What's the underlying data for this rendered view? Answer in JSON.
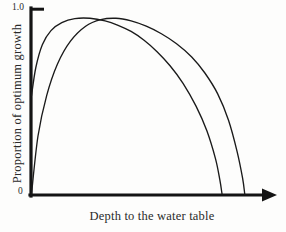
{
  "chart_data": {
    "type": "line",
    "title": "",
    "subtitle": "",
    "xlabel": "Depth to the water table",
    "ylabel": "Proportion of optimum growth",
    "xlim": [
      0,
      1
    ],
    "ylim": [
      0,
      1.05
    ],
    "grid": false,
    "legend": "none",
    "x_tick_labels": [],
    "y_tick_labels": [
      "0",
      "1.0"
    ],
    "y_ticks": [
      0,
      1.0
    ],
    "axis_color": "#141414",
    "curve_color": "#1a1a1a",
    "x_axis_has_arrow": true,
    "annotations": [],
    "series": [
      {
        "name": "shallow-rooted species",
        "color": "#1a1a1a",
        "comment": "rises steeply from y-axis, peaks early, declines to zero at intermediate depth",
        "x": [
          0.0,
          0.02,
          0.05,
          0.09,
          0.14,
          0.2,
          0.27,
          0.34,
          0.4,
          0.46,
          0.52,
          0.58,
          0.64,
          0.7,
          0.76,
          0.81,
          0.85,
          0.87,
          0.88
        ],
        "y": [
          0.56,
          0.72,
          0.85,
          0.93,
          0.975,
          0.998,
          1.0,
          0.985,
          0.96,
          0.925,
          0.875,
          0.81,
          0.73,
          0.63,
          0.5,
          0.36,
          0.2,
          0.08,
          0.0
        ]
      },
      {
        "name": "deep-rooted species",
        "color": "#1a1a1a",
        "comment": "rises more gradually from lower start, peaks slightly later, persists to greater depth",
        "x": [
          0.0,
          0.03,
          0.07,
          0.12,
          0.18,
          0.25,
          0.32,
          0.39,
          0.46,
          0.53,
          0.6,
          0.67,
          0.74,
          0.8,
          0.86,
          0.91,
          0.95,
          0.975,
          0.985
        ],
        "y": [
          0.0,
          0.33,
          0.56,
          0.74,
          0.87,
          0.955,
          0.992,
          1.0,
          0.985,
          0.955,
          0.912,
          0.855,
          0.78,
          0.69,
          0.57,
          0.42,
          0.24,
          0.09,
          0.0
        ]
      }
    ]
  },
  "labels": {
    "xlabel": "Depth to the water table",
    "ylabel": "Proportion of optimum growth",
    "tick_top": "1.0",
    "tick_zero": "0"
  }
}
